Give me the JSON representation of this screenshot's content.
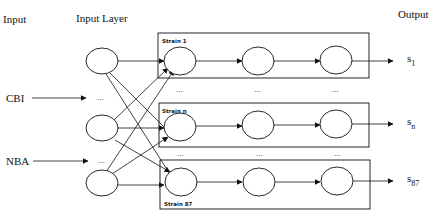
{
  "headers": {
    "input": "Input",
    "input_layer": "Input Layer",
    "output": "Output"
  },
  "inputs": [
    {
      "label": "CBI"
    },
    {
      "label": "NBA"
    }
  ],
  "ellipsis": "...",
  "strains": [
    {
      "label": "Strain 1",
      "output": "s",
      "output_sub": "1"
    },
    {
      "label": "Strain n",
      "output": "s",
      "output_sub": "n"
    },
    {
      "label": "Strain 87",
      "output": "s",
      "output_sub": "87"
    }
  ],
  "colors": {
    "line": "#111111",
    "background": "#ffffff"
  }
}
